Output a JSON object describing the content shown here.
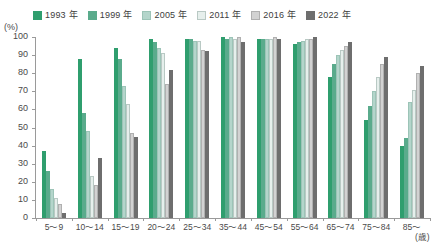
{
  "chart_data": {
    "type": "bar",
    "title": "",
    "xlabel": "(歳)",
    "ylabel": "(%)",
    "ylim": [
      0,
      100
    ],
    "ytick_step": 10,
    "grid": false,
    "legend_position": "top",
    "categories": [
      "5〜9",
      "10〜14",
      "15〜19",
      "20〜24",
      "25〜34",
      "35〜44",
      "45〜54",
      "55〜64",
      "65〜74",
      "75〜84",
      "85〜"
    ],
    "yticks": [
      "0",
      "10",
      "20",
      "30",
      "40",
      "50",
      "60",
      "70",
      "80",
      "90",
      "100"
    ],
    "series": [
      {
        "name": "1993 年",
        "color": "#2f9e6e",
        "border": "#2f9e6e",
        "values": [
          37,
          88,
          94,
          99,
          99,
          100,
          99,
          96,
          78,
          54,
          40
        ]
      },
      {
        "name": "1999 年",
        "color": "#5aab8c",
        "border": "#5aab8c",
        "values": [
          26,
          58,
          88,
          97,
          99,
          99,
          99,
          97,
          85,
          62,
          44
        ]
      },
      {
        "name": "2005 年",
        "color": "#b4d5cb",
        "border": "#9cc4b7",
        "values": [
          16,
          48,
          73,
          94,
          98,
          100,
          99,
          98,
          90,
          70,
          64
        ]
      },
      {
        "name": "2011 年",
        "color": "#e6efec",
        "border": "#b9c9c4",
        "values": [
          11,
          23,
          63,
          91,
          98,
          99,
          99,
          99,
          93,
          78,
          71
        ]
      },
      {
        "name": "2016 年",
        "color": "#d2d2d2",
        "border": "#b0b0b0",
        "values": [
          8,
          18,
          47,
          74,
          93,
          100,
          100,
          99,
          95,
          85,
          80
        ]
      },
      {
        "name": "2022 年",
        "color": "#6e6e6e",
        "border": "#6e6e6e",
        "values": [
          3,
          33,
          45,
          82,
          92,
          97,
          99,
          100,
          97,
          89,
          84
        ]
      }
    ]
  }
}
